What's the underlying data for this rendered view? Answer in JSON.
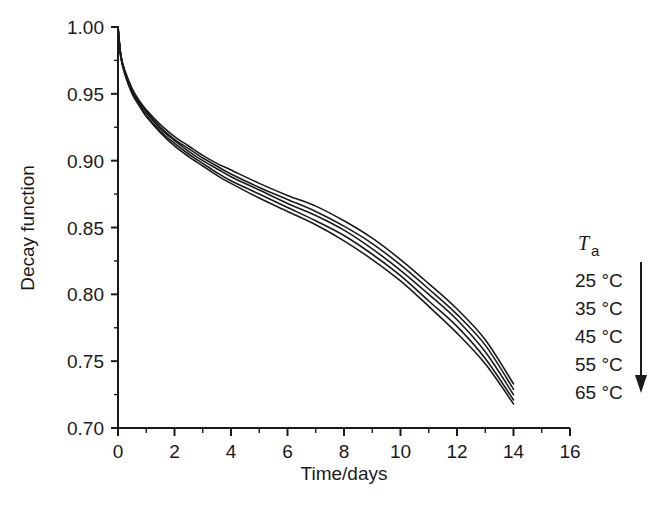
{
  "chart_data": {
    "type": "line",
    "title": "",
    "xlabel": "Time/days",
    "ylabel": "Decay function",
    "xlim": [
      0,
      16
    ],
    "ylim": [
      0.7,
      1.0
    ],
    "xticks": [
      0,
      2,
      4,
      6,
      8,
      10,
      12,
      14,
      16
    ],
    "xtick_labels": [
      "0",
      "2",
      "4",
      "6",
      "8",
      "10",
      "12",
      "14",
      "16"
    ],
    "yticks": [
      0.7,
      0.75,
      0.8,
      0.85,
      0.9,
      0.95,
      1.0
    ],
    "ytick_labels": [
      "0.70",
      "0.75",
      "0.80",
      "0.85",
      "0.90",
      "0.95",
      "1.00"
    ],
    "x_minor_step": 1,
    "y_minor_step": 0.025,
    "grid": false,
    "legend_position": "right",
    "line_color": "#1a1a1a",
    "x": [
      0,
      0.1,
      0.25,
      0.5,
      0.75,
      1,
      1.5,
      2,
      2.5,
      3,
      3.5,
      4,
      5,
      6,
      7,
      8,
      9,
      10,
      11,
      12,
      13,
      14
    ],
    "series": [
      {
        "name": "25 °C",
        "temperature_c": 25,
        "values": [
          1.0,
          0.979,
          0.967,
          0.954,
          0.945,
          0.938,
          0.927,
          0.918,
          0.911,
          0.904,
          0.898,
          0.893,
          0.883,
          0.874,
          0.866,
          0.855,
          0.842,
          0.826,
          0.808,
          0.789,
          0.766,
          0.733
        ]
      },
      {
        "name": "35 °C",
        "temperature_c": 35,
        "values": [
          1.0,
          0.979,
          0.966,
          0.953,
          0.944,
          0.937,
          0.925,
          0.916,
          0.909,
          0.902,
          0.896,
          0.89,
          0.88,
          0.871,
          0.862,
          0.851,
          0.838,
          0.822,
          0.804,
          0.785,
          0.762,
          0.729
        ]
      },
      {
        "name": "45 °C",
        "temperature_c": 45,
        "values": [
          1.0,
          0.978,
          0.966,
          0.952,
          0.943,
          0.936,
          0.924,
          0.915,
          0.907,
          0.9,
          0.894,
          0.888,
          0.878,
          0.868,
          0.859,
          0.848,
          0.834,
          0.818,
          0.8,
          0.781,
          0.757,
          0.725
        ]
      },
      {
        "name": "55 °C",
        "temperature_c": 55,
        "values": [
          1.0,
          0.978,
          0.965,
          0.951,
          0.942,
          0.934,
          0.922,
          0.913,
          0.905,
          0.898,
          0.891,
          0.885,
          0.875,
          0.865,
          0.855,
          0.844,
          0.83,
          0.814,
          0.795,
          0.776,
          0.752,
          0.721
        ]
      },
      {
        "name": "65 °C",
        "temperature_c": 65,
        "values": [
          1.0,
          0.977,
          0.964,
          0.95,
          0.941,
          0.933,
          0.921,
          0.911,
          0.903,
          0.896,
          0.889,
          0.883,
          0.872,
          0.862,
          0.852,
          0.84,
          0.826,
          0.81,
          0.791,
          0.771,
          0.748,
          0.718
        ]
      }
    ],
    "annotations": [
      {
        "type": "legend-heading",
        "symbol": "T",
        "subscript": "a"
      },
      {
        "type": "arrow",
        "direction": "down",
        "meaning": "increasing ambient temperature"
      }
    ]
  },
  "legend": {
    "heading_symbol": "T",
    "heading_subscript": "a",
    "entries": [
      {
        "label": "25 °C"
      },
      {
        "label": "35 °C"
      },
      {
        "label": "45 °C"
      },
      {
        "label": "55 °C"
      },
      {
        "label": "65 °C"
      }
    ]
  },
  "axes": {
    "x_title": "Time/days",
    "y_title": "Decay function"
  }
}
